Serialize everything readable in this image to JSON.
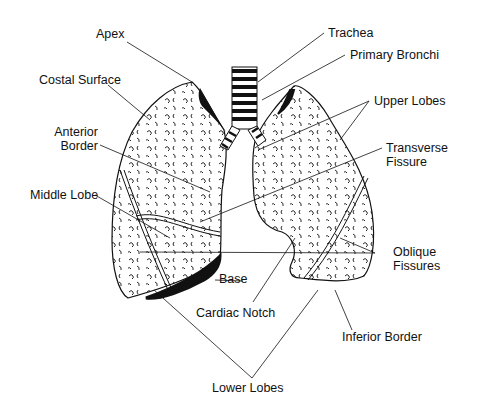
{
  "diagram": {
    "colors": {
      "ink": "#111111",
      "background": "#ffffff"
    },
    "labels": {
      "apex": "Apex",
      "costal_surface": "Costal Surface",
      "anterior_border_1": "Anterior",
      "anterior_border_2": "Border",
      "middle_lobe": "Middle Lobe",
      "trachea": "Trachea",
      "primary_bronchi": "Primary Bronchi",
      "upper_lobes": "Upper Lobes",
      "transverse_fissure_1": "Transverse",
      "transverse_fissure_2": "Fissure",
      "oblique_fissures_1": "Oblique",
      "oblique_fissures_2": "Fissures",
      "base": "Base",
      "cardiac_notch": "Cardiac Notch",
      "inferior_border": "Inferior Border",
      "lower_lobes": "Lower Lobes"
    }
  }
}
